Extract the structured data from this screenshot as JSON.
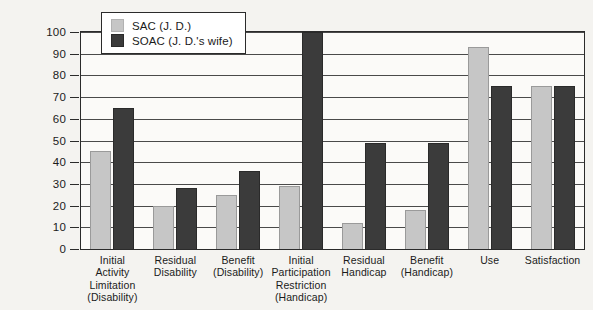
{
  "chart_data": {
    "type": "bar",
    "title": "",
    "xlabel": "",
    "ylabel": "",
    "ylim": [
      0,
      100
    ],
    "yticks": [
      0,
      10,
      20,
      30,
      40,
      50,
      60,
      70,
      80,
      90,
      100
    ],
    "grid": true,
    "legend_position": "top-left-inside",
    "categories": [
      "Initial Activity Limitation (Disability)",
      "Residual Disability",
      "Benefit (Disability)",
      "Initial Participation Restriction (Handicap)",
      "Residual Handicap",
      "Benefit (Handicap)",
      "Use",
      "Satisfaction"
    ],
    "category_lines": [
      [
        "Initial",
        "Activity",
        "Limitation",
        "(Disability)"
      ],
      [
        "Residual",
        "Disability"
      ],
      [
        "Benefit",
        "(Disability)"
      ],
      [
        "Initial",
        "Participation",
        "Restriction",
        "(Handicap)"
      ],
      [
        "Residual",
        "Handicap"
      ],
      [
        "Benefit",
        "(Handicap)"
      ],
      [
        "Use"
      ],
      [
        "Satisfaction"
      ]
    ],
    "series": [
      {
        "name": "SAC (J. D.)",
        "color": "#c6c6c6",
        "values": [
          45,
          20,
          25,
          29,
          12,
          18,
          93,
          75
        ]
      },
      {
        "name": "SOAC (J. D.'s wife)",
        "color": "#3b3b3b",
        "values": [
          65,
          28,
          36,
          100,
          49,
          49,
          75,
          75
        ]
      }
    ]
  },
  "legend": {
    "entries": [
      {
        "label": "SAC (J. D.)",
        "swatch": "sac"
      },
      {
        "label": "SOAC (J. D.'s wife)",
        "swatch": "soac"
      }
    ]
  }
}
